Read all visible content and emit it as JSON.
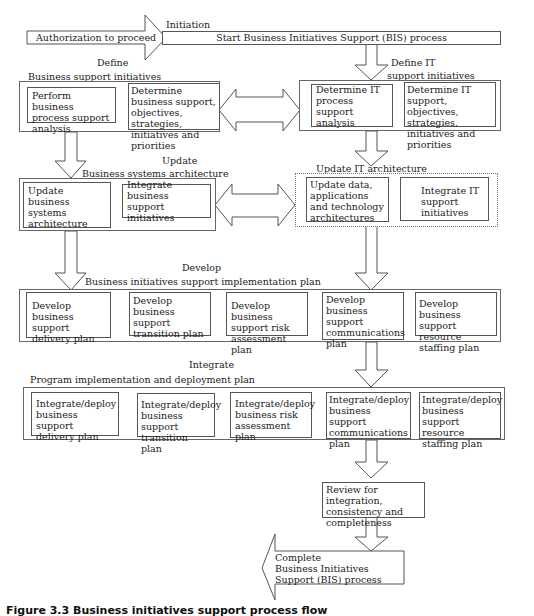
{
  "initiation": {
    "arrow_label": "Authorization to proceed",
    "phase_label": "Initiation",
    "start_box": "Start Business Initiatives Support (BIS) process"
  },
  "define": {
    "phase_label": "Define",
    "business": {
      "title": "Business support initiatives",
      "steps": [
        "Perform business process support analysis",
        "Determine business support, objectives, strategies, initiatives and priorities"
      ]
    },
    "it": {
      "title_line1": "Define IT",
      "title_line2": "support initiatives",
      "steps": [
        "Determine IT process support analysis",
        "Determine IT support, objectives, strategies, initiatives and priorities"
      ]
    }
  },
  "update": {
    "phase_label": "Update",
    "business": {
      "title": "Business systems architecture",
      "steps": [
        "Update business systems architecture",
        "Integrate business support initiatives"
      ]
    },
    "it": {
      "title": "Update IT architecture",
      "steps": [
        "Update data, applications and technology architectures",
        "Integrate IT support initiatives"
      ]
    }
  },
  "develop": {
    "phase_label": "Develop",
    "title": "Business initiatives support implementation plan",
    "steps": [
      "Develop business support delivery plan",
      "Develop business support transition plan",
      "Develop business support risk assessment plan",
      "Develop business support communications plan",
      "Develop business support resource staffing plan"
    ]
  },
  "integrate": {
    "phase_label": "Integrate",
    "title": "Program implementation and deployment plan",
    "steps": [
      "Integrate/deploy business support delivery plan",
      "Integrate/deploy business support transition plan",
      "Integrate/deploy business risk assessment plan",
      "Integrate/deploy business support communications plan",
      "Integrate/deploy business support resource staffing plan"
    ]
  },
  "review": {
    "text": "Review for integration, consistency and completeness"
  },
  "complete": {
    "line1": "Complete",
    "line2": "Business Initiatives",
    "line3": "Support (BIS) process"
  },
  "caption": "Figure 3.3 Business initiatives support process flow"
}
